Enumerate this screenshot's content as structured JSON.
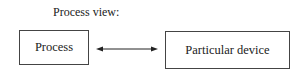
{
  "diagram": {
    "title": "Process view:",
    "nodes": [
      {
        "id": "process",
        "label": "Process"
      },
      {
        "id": "device",
        "label": "Particular device"
      }
    ],
    "edges": [
      {
        "from": "process",
        "to": "device",
        "type": "bidirectional-arrow"
      }
    ]
  }
}
